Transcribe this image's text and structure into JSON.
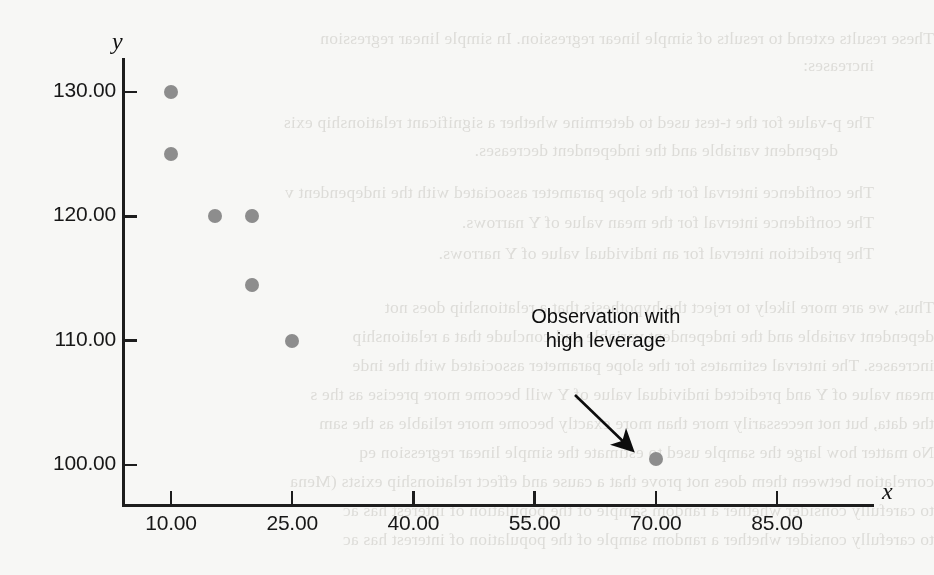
{
  "figure": {
    "background_color": "#f7f7f5",
    "marker_color": "#8d8d8d",
    "axis_color": "#1d1d1d",
    "annotation_color": "#0d0d0d"
  },
  "chart_data": {
    "type": "scatter",
    "title": "",
    "xlabel": "x",
    "ylabel": "y",
    "xlim": [
      2,
      94
    ],
    "ylim": [
      96,
      133
    ],
    "grid": false,
    "legend": null,
    "x_ticks": [
      {
        "value": 10,
        "label": "10.00"
      },
      {
        "value": 25,
        "label": "25.00"
      },
      {
        "value": 40,
        "label": "40.00"
      },
      {
        "value": 55,
        "label": "55.00"
      },
      {
        "value": 70,
        "label": "70.00"
      },
      {
        "value": 85,
        "label": "85.00"
      }
    ],
    "y_ticks": [
      {
        "value": 100,
        "label": "100.00"
      },
      {
        "value": 110,
        "label": "110.00"
      },
      {
        "value": 120,
        "label": "120.00"
      },
      {
        "value": 130,
        "label": "130.00"
      }
    ],
    "x": [
      10,
      10,
      15.5,
      20,
      20,
      25,
      70
    ],
    "y": [
      130,
      125,
      120,
      120,
      114.5,
      110,
      100.5
    ],
    "points": [
      {
        "x": 10,
        "y": 130.0
      },
      {
        "x": 10,
        "y": 125.0
      },
      {
        "x": 15.5,
        "y": 120.0
      },
      {
        "x": 20,
        "y": 120.0
      },
      {
        "x": 20,
        "y": 114.5
      },
      {
        "x": 25,
        "y": 110.0
      },
      {
        "x": 70,
        "y": 100.5
      }
    ],
    "annotations": [
      {
        "text_line1": "Observation with",
        "text_line2": "high leverage",
        "points_to": {
          "x": 70,
          "y": 100.5
        }
      }
    ]
  },
  "bleed_text": {
    "lines": [
      "These results extend to results of simple linear regression. In simple linear regression",
      "increases:",
      "The p-value for the t-test used to determine whether a significant relationship exis",
      "dependent variable and the independent decreases.",
      "The confidence interval for the slope parameter associated with the independent v",
      "The confidence interval for the mean value of Y narrows.",
      "The prediction interval for an individual value of Y narrows.",
      "Thus, we are more likely to reject the hypothesis that a relationship does not",
      "dependent variable and the independent variable and conclude that a relationship",
      "increases. The interval estimates for the slope parameter associated with the inde",
      "mean value of Y and predicted individual value of Y will become more precise as the s",
      "the data, but not necessarily more than more exactly become more reliable as the sam",
      "No matter how large the sample used to estimate the simple linear regression eq",
      "correlation between them does not prove that a cause and effect relationship exists (Mena",
      "to carefully consider whether a random sample of the population of interest has ac"
    ]
  }
}
